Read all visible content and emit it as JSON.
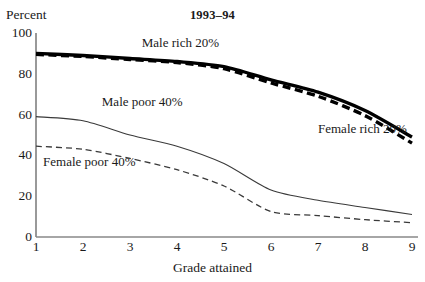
{
  "chart_data": {
    "type": "line",
    "title": "1993–94",
    "xlabel": "Grade attained",
    "ylabel": "Percent",
    "x": [
      1,
      2,
      3,
      4,
      5,
      6,
      7,
      8,
      9
    ],
    "xtick_labels": [
      "1",
      "2",
      "3",
      "4",
      "5",
      "6",
      "7",
      "8",
      "9"
    ],
    "ytick_labels": [
      "0",
      "20",
      "40",
      "60",
      "80",
      "100"
    ],
    "yticks": [
      0,
      20,
      40,
      60,
      80,
      100
    ],
    "xlim": [
      1,
      9
    ],
    "ylim": [
      0,
      100
    ],
    "grid": false,
    "legend_position": "inline-annotations",
    "series": [
      {
        "name": "Male rich 20%",
        "style": "thick-solid",
        "color": "#000000",
        "values": [
          90,
          89,
          87.5,
          86,
          83.5,
          77,
          71,
          62,
          49
        ],
        "label_x": 3.25,
        "label_y": 95
      },
      {
        "name": "Female rich 20%",
        "style": "thick-dashed",
        "color": "#000000",
        "values": [
          89.5,
          88.5,
          87,
          85.5,
          82.5,
          75.5,
          69,
          59.5,
          46
        ],
        "label_x": 7.0,
        "label_y": 53
      },
      {
        "name": "Male poor 40%",
        "style": "thin-solid",
        "color": "#3a3a3a",
        "values": [
          59,
          57,
          50,
          44.5,
          36,
          23,
          18,
          14.5,
          11
        ],
        "label_x": 2.4,
        "label_y": 66
      },
      {
        "name": "Female poor 40%",
        "style": "thin-dashed",
        "color": "#3a3a3a",
        "values": [
          44.5,
          43,
          38.5,
          33,
          25,
          12.5,
          10.5,
          8.5,
          7
        ],
        "label_x": 1.15,
        "label_y": 37
      }
    ]
  },
  "axis": {
    "percent_label": "Percent",
    "title": "1993–94",
    "xaxis_title": "Grade attained"
  }
}
